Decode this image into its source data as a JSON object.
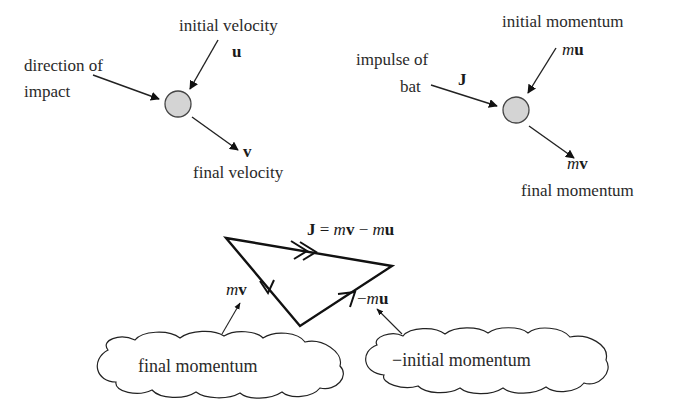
{
  "panel_velocity": {
    "initial_label": "initial velocity",
    "initial_symbol": "u",
    "impact_label_line1": "direction of",
    "impact_label_line2": "impact",
    "final_symbol": "v",
    "final_label": "final velocity"
  },
  "panel_momentum": {
    "initial_label": "initial momentum",
    "initial_symbol_m": "m",
    "initial_symbol_u": "u",
    "impulse_label_line1": "impulse of",
    "impulse_label_line2": "bat",
    "impulse_symbol": "J",
    "final_symbol_m": "m",
    "final_symbol_v": "v",
    "final_label": "final momentum"
  },
  "vector_triangle": {
    "equation": {
      "J": "J",
      "eq": " = ",
      "m1": "m",
      "v": "v",
      "minus": " − ",
      "m2": "m",
      "u": "u"
    },
    "mv_m": "m",
    "mv_v": "v",
    "neg_mu_minus": "−",
    "neg_mu_m": "m",
    "neg_mu_u": "u"
  },
  "clouds": {
    "left": "final momentum",
    "right": "−initial momentum"
  },
  "colors": {
    "ink": "#1a1a1a",
    "ball_fill": "#d4d4d4",
    "ball_stroke": "#444444"
  }
}
